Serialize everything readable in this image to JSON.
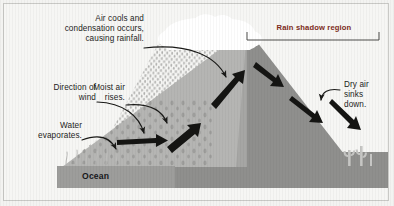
{
  "figure": {
    "type": "diagram",
    "width": 394,
    "height": 206,
    "background_color": "#f6f6f4",
    "border_color": "#c9c9c6"
  },
  "labels": {
    "air_cools": "Air cools and\ncondensation occurs,\ncausing rainfall.",
    "direction_of_wind": "Direction of\nwind",
    "water_evaporates": "Water\nevaporates.",
    "moist_air_rises": "Moist air\nrises.",
    "rain_shadow_region": "Rain shadow region",
    "dry_air_sinks": "Dry air\nsinks\ndown.",
    "ocean": "Ocean"
  },
  "colors": {
    "rain_shadow_text": "#7d2b20",
    "label_text": "#1d1d1b",
    "ocean_band": "#9d9d9b",
    "mountain_light": "#b4b4b2",
    "mountain_mid": "#a0a09e",
    "mountain_dark": "#8e8e8c",
    "cloud": "#ffffff",
    "arrow": "#1a1a18",
    "rain_dots": "#b9b9b7"
  },
  "elements": {
    "cloud_name": "rain-cloud",
    "mountain_name": "mountain",
    "ocean_name": "ocean-band",
    "cacti_name": "desert-cacti",
    "rain_name": "rainfall-dots",
    "evaporation_name": "evaporation-wisps",
    "bracket_name": "rain-shadow-bracket"
  },
  "arrows": [
    {
      "name": "arrow-air-cools-to-cloud",
      "style": "thin-curved"
    },
    {
      "name": "arrow-direction-of-wind",
      "style": "thin-curved"
    },
    {
      "name": "arrow-water-evaporates",
      "style": "thin-curved"
    },
    {
      "name": "arrow-moist-air-rises",
      "style": "thin-curved"
    },
    {
      "name": "arrow-wind-horizontal-thick",
      "style": "thick-block"
    },
    {
      "name": "arrow-upslope-lower",
      "style": "thick-block"
    },
    {
      "name": "arrow-upslope-upper",
      "style": "thick-block"
    },
    {
      "name": "arrow-downslope-upper",
      "style": "thick-block"
    },
    {
      "name": "arrow-downslope-lower",
      "style": "thick-block"
    },
    {
      "name": "arrow-dry-air-sinks-pointer",
      "style": "thin-curved"
    },
    {
      "name": "arrow-dry-air-sinks-thick",
      "style": "thick-block"
    }
  ]
}
